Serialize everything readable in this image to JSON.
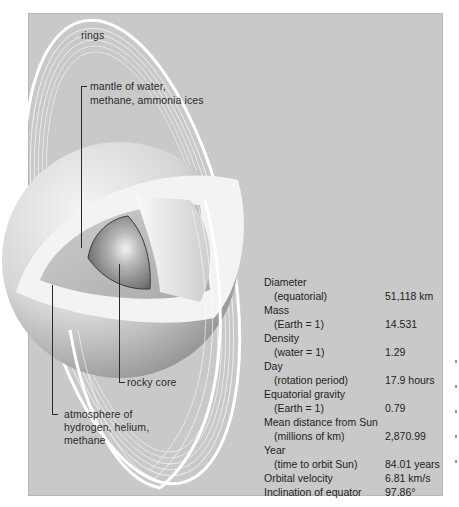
{
  "diagram": {
    "background_color": "#c9c9c9",
    "labels": {
      "rings": "rings",
      "mantle_line1": "mantle of water,",
      "mantle_line2": "methane, ammonia ices",
      "core": "rocky core",
      "atmosphere_line1": "atmosphere of",
      "atmosphere_line2": "hydrogen, helium,",
      "atmosphere_line3": "methane"
    }
  },
  "stats": [
    {
      "label": "Diameter",
      "value": ""
    },
    {
      "label": "(equatorial)",
      "value": "51,118 km",
      "sub": true
    },
    {
      "label": "Mass",
      "value": ""
    },
    {
      "label": "(Earth = 1)",
      "value": "14.531",
      "sub": true
    },
    {
      "label": "Density",
      "value": ""
    },
    {
      "label": "(water = 1)",
      "value": "1.29",
      "sub": true
    },
    {
      "label": "Day",
      "value": ""
    },
    {
      "label": "(rotation period)",
      "value": "17.9 hours",
      "sub": true
    },
    {
      "label": "Equatorial gravity",
      "value": ""
    },
    {
      "label": "(Earth = 1)",
      "value": "0.79",
      "sub": true
    },
    {
      "label": "Mean distance from Sun",
      "value": ""
    },
    {
      "label": "(millions of km)",
      "value": "2,870.99",
      "sub": true
    },
    {
      "label": "Year",
      "value": ""
    },
    {
      "label": "(time to orbit Sun)",
      "value": "84.01 years",
      "sub": true
    },
    {
      "label": "Orbital velocity",
      "value": "6.81 km/s"
    },
    {
      "label": "Inclination of equator",
      "value": "97.86°"
    }
  ]
}
